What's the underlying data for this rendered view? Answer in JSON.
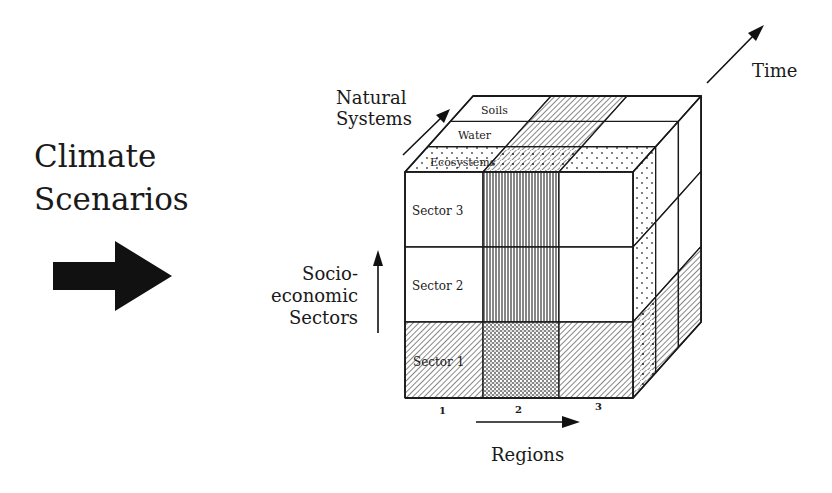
{
  "input": {
    "title_line1": "Climate",
    "title_line2": "Scenarios",
    "arrow_icon": "right-block-arrow"
  },
  "axes": {
    "time": {
      "label": "Time",
      "icon": "diagonal-arrow-up-right"
    },
    "natural_systems": {
      "label_line1": "Natural",
      "label_line2": "Systems",
      "icon": "diagonal-arrow-up-right"
    },
    "sectors": {
      "label_line1": "Socio-",
      "label_line2": "economic",
      "label_line3": "Sectors",
      "icon": "arrow-up"
    },
    "regions": {
      "label": "Regions",
      "icon": "arrow-right"
    }
  },
  "cube": {
    "front_rows": [
      {
        "label": "Sector 3",
        "cells": [
          "blank",
          "vertical-hatch",
          "blank"
        ]
      },
      {
        "label": "Sector 2",
        "cells": [
          "blank",
          "vertical-hatch",
          "blank"
        ]
      },
      {
        "label": "Sector 1",
        "cells": [
          "diagonal-hatch",
          "cross-hatch",
          "diagonal-hatch"
        ]
      }
    ],
    "top_layers": [
      {
        "label": "Ecosystems",
        "cells": [
          "dotted",
          "diagonal-dotted",
          "dotted"
        ]
      },
      {
        "label": "Water",
        "cells": [
          "blank",
          "diagonal-hatch",
          "blank"
        ]
      },
      {
        "label": "Soils",
        "cells": [
          "blank",
          "diagonal-hatch",
          "blank"
        ]
      }
    ],
    "region_numbers": [
      "1",
      "2",
      "3"
    ],
    "colors": {
      "line": "#1a1a1a",
      "hatch": "#444444",
      "background": "#ffffff"
    }
  }
}
